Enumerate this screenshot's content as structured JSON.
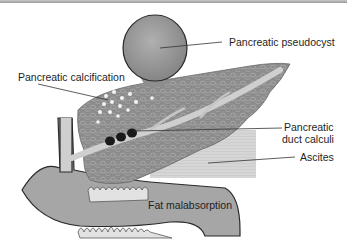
{
  "figure": {
    "type": "anatomical illustration",
    "labels": {
      "pseudocyst": "Pancreatic pseudocyst",
      "calcification": "Pancreatic calcification",
      "duct_calculi_line1": "Pancreatic",
      "duct_calculi_line2": "duct calculi",
      "ascites": "Ascites",
      "fat_malabsorption": "Fat malabsorption"
    },
    "colors": {
      "pancreas": "#8a8a8a",
      "pseudocyst": "#9a9a9a",
      "duodenum": "#a6a6a6",
      "duct": "#cfcfcf",
      "calculi": "#1a1a1a",
      "ascites": "#d9d9d9",
      "outline": "#2a2a2a"
    }
  }
}
